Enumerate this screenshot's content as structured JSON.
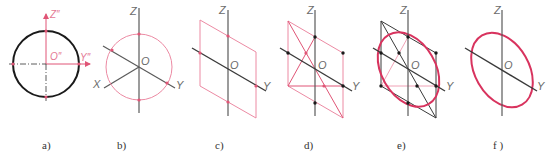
{
  "colors": {
    "pink": "#e05576",
    "pink_light": "#ec8aa3",
    "axis_gray": "#5a5a5a",
    "black": "#1a1a1a",
    "ellipse": "#d8335e"
  },
  "panels": [
    {
      "id": "a",
      "caption": "a)",
      "labels": {
        "z": "Z″",
        "o": "O″",
        "y": "Y″"
      }
    },
    {
      "id": "b",
      "caption": "b)",
      "labels": {
        "z": "Z",
        "o": "O",
        "x": "X",
        "y": "Y"
      }
    },
    {
      "id": "c",
      "caption": "c)",
      "labels": {
        "z": "Z",
        "o": "O",
        "y": "Y"
      }
    },
    {
      "id": "d",
      "caption": "d)",
      "labels": {
        "z": "Z",
        "o": "O",
        "y": "Y"
      }
    },
    {
      "id": "e",
      "caption": "e)",
      "labels": {
        "z": "Z",
        "o": "O",
        "y": "Y"
      }
    },
    {
      "id": "f",
      "caption": "f )",
      "labels": {
        "z": "Z",
        "o": "O",
        "y": "Y"
      }
    }
  ]
}
